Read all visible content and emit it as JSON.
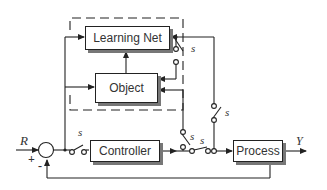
{
  "blocks": {
    "learning_net": "Learning Net",
    "object": "Object",
    "controller": "Controller",
    "process": "Process"
  },
  "signals": {
    "reference": "R",
    "output": "Y",
    "plus_sign": "+",
    "minus_sign": "-"
  },
  "switches": {
    "label": "s",
    "learning_net_switch": "s",
    "object_switch": "s",
    "controller_switch": "s",
    "process_input_switch": "s",
    "series_switch": "s"
  },
  "colors": {
    "line": "#222222",
    "shadow": "#777777",
    "text": "#333333"
  }
}
